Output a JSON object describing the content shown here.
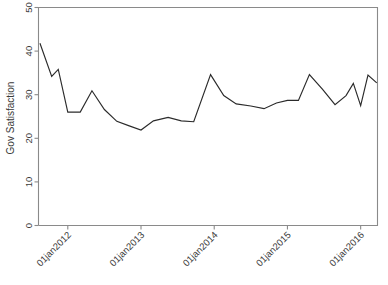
{
  "chart_data": {
    "type": "line",
    "title": "",
    "xlabel": "",
    "ylabel": "Gov Satisfaction",
    "ylim": [
      0,
      50
    ],
    "yticks": [
      0,
      10,
      20,
      30,
      40,
      50
    ],
    "ytick_labels": [
      "0",
      "10",
      "20",
      "30",
      "40",
      "50"
    ],
    "xtick_labels": [
      "01jan2012",
      "01jan2013",
      "01jan2014",
      "01jan2015",
      "01jan2016"
    ],
    "xtick_values": [
      2012.0,
      2013.0,
      2014.0,
      2015.0,
      2016.0
    ],
    "xlim": [
      2011.6,
      2016.23
    ],
    "grid": false,
    "legend": false,
    "legend_position": "none",
    "line_color": "#2b2b2b",
    "axis_color": "#8a8a8a",
    "background_color": "#ffffff",
    "series": [
      {
        "name": "Gov Satisfaction",
        "x": [
          2011.62,
          2011.78,
          2011.87,
          2012.0,
          2012.17,
          2012.33,
          2012.5,
          2012.67,
          2012.83,
          2013.0,
          2013.17,
          2013.37,
          2013.55,
          2013.72,
          2013.95,
          2014.13,
          2014.3,
          2014.5,
          2014.68,
          2014.85,
          2015.0,
          2015.15,
          2015.3,
          2015.48,
          2015.65,
          2015.8,
          2015.9,
          2016.0,
          2016.1,
          2016.22
        ],
        "y": [
          41.8,
          34.2,
          35.8,
          26.0,
          26.0,
          30.9,
          26.6,
          23.9,
          22.9,
          21.9,
          24.0,
          24.8,
          24.0,
          23.8,
          34.6,
          29.8,
          27.9,
          27.4,
          26.8,
          28.1,
          28.7,
          28.7,
          34.6,
          31.2,
          27.7,
          29.8,
          32.6,
          27.5,
          34.5,
          32.7
        ]
      }
    ]
  }
}
